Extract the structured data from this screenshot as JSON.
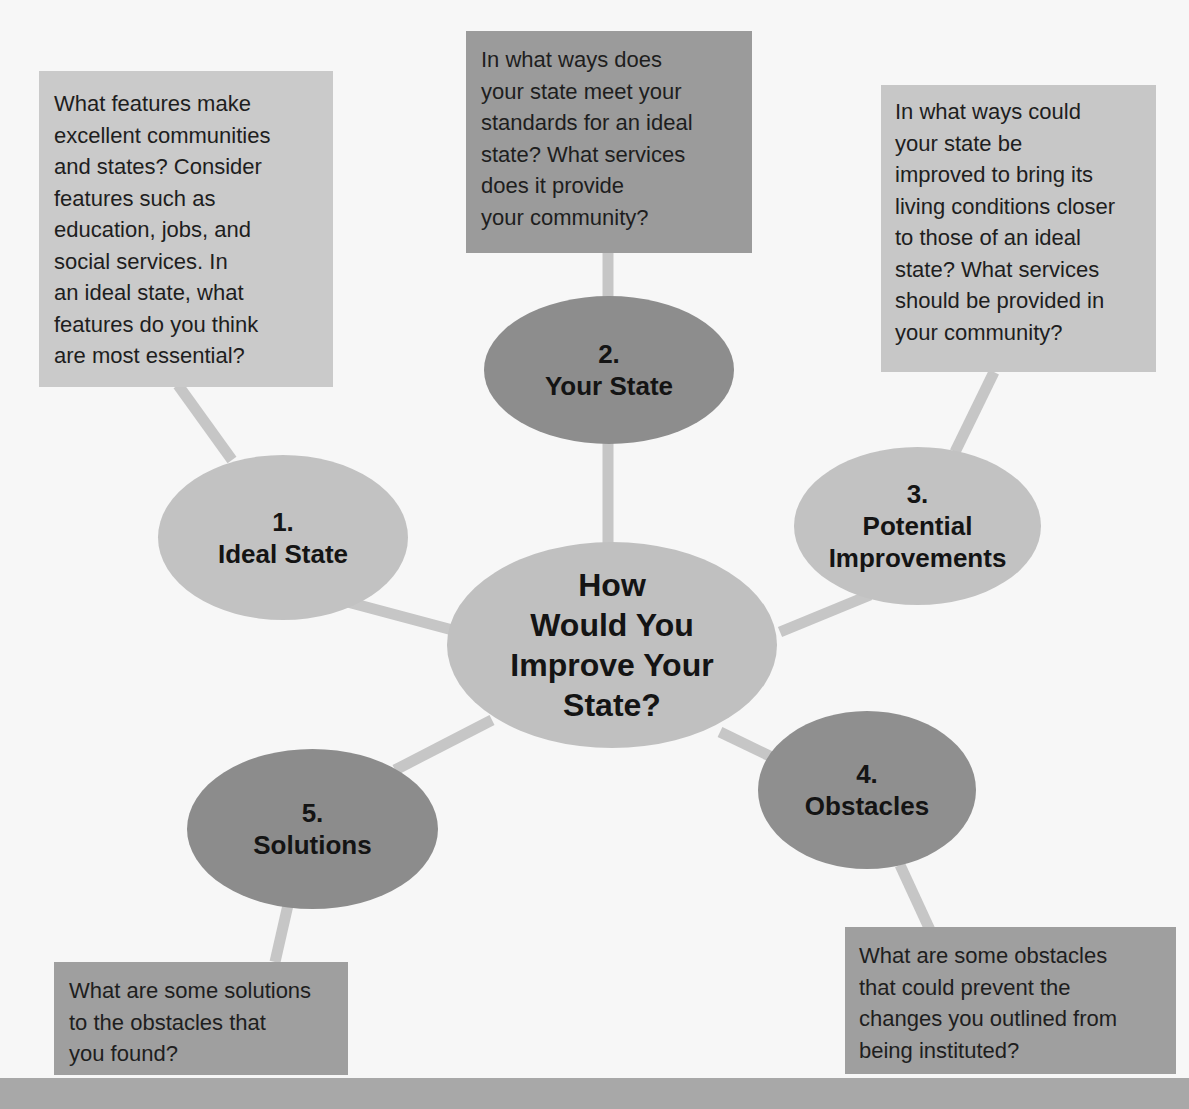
{
  "colors": {
    "background": "#f7f7f7",
    "light_gray": "#c9c9c9",
    "mid_gray": "#a9a9a9",
    "dark_gray": "#8a8a8a",
    "connector": "#c4c4c4",
    "footer_bar": "#a8a8a8"
  },
  "center": {
    "label": "How\nWould You\nImprove Your\nState?"
  },
  "nodes": [
    {
      "number": "1.",
      "label": "Ideal State",
      "prompt": "What features make\nexcellent communities\nand states? Consider\nfeatures such as\neducation, jobs, and\nsocial services. In\nan ideal state, what\nfeatures do you think\nare most essential?"
    },
    {
      "number": "2.",
      "label": "Your State",
      "prompt": "In what ways does\nyour state meet your\nstandards for an ideal\nstate? What services\ndoes it provide\nyour community?"
    },
    {
      "number": "3.",
      "label": "Potential\nImprovements",
      "prompt": "In what ways could\nyour state be\nimproved to bring its\nliving conditions closer\nto those of an ideal\nstate? What services\nshould be provided in\nyour community?"
    },
    {
      "number": "4.",
      "label": "Obstacles",
      "prompt": "What are some obstacles\nthat could prevent the\nchanges you outlined from\nbeing instituted?"
    },
    {
      "number": "5.",
      "label": "Solutions",
      "prompt": "What are some solutions\nto the obstacles that\nyou found?"
    }
  ]
}
